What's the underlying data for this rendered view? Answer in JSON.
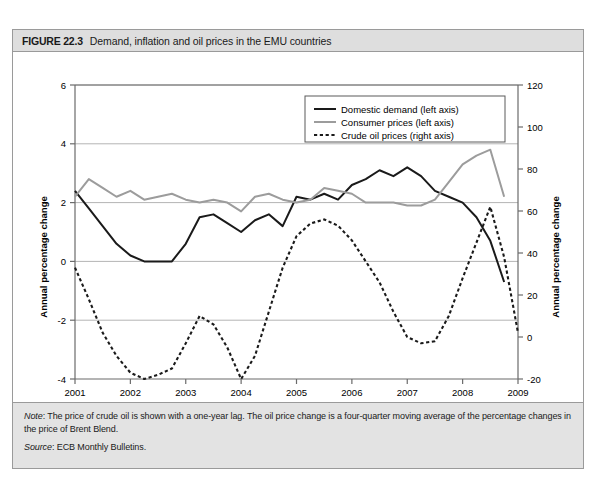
{
  "figure": {
    "number": "FIGURE 22.3",
    "title": "Demand, inflation and oil prices in the EMU countries"
  },
  "note": {
    "lead": "Note",
    "text": ": The price of crude oil is shown with a one-year lag. The oil price change is a four-quarter moving average of the percentage changes in the price of Brent Blend.",
    "source_lead": "Source",
    "source_text": ": ECB Monthly Bulletins."
  },
  "colors": {
    "demand": "#1a1a1a",
    "prices": "#9c9c9c",
    "oil": "#1a1a1a",
    "grid": "#b4b4b4",
    "axis": "#6b6b6b",
    "header_bg": "#dedede",
    "note_bg": "#e3e3e3"
  },
  "chart_data": {
    "type": "line",
    "title": "Demand, inflation and oil prices in the EMU countries",
    "xlabel": "",
    "ylabel": "Annual percentage change",
    "ylabel_right": "Annual percentage change",
    "xlim": [
      2001,
      2009
    ],
    "ylim": [
      -4,
      6
    ],
    "ylim_right": [
      -20,
      120
    ],
    "yticks": [
      -4,
      -2,
      0,
      2,
      4,
      6
    ],
    "yticks_right": [
      -20,
      0,
      20,
      40,
      60,
      80,
      100,
      120
    ],
    "xticks": [
      2001,
      2002,
      2003,
      2004,
      2005,
      2006,
      2007,
      2008,
      2009
    ],
    "xtick_labels": [
      "2001",
      "2002",
      "2003",
      "2004",
      "2005",
      "2006",
      "2007",
      "2008",
      "2009"
    ],
    "grid": true,
    "legend_position": "upper center",
    "series": [
      {
        "name": "Domestic demand (left axis)",
        "axis": "left",
        "style": "solid",
        "color": "#1a1a1a",
        "x": [
          2001.0,
          2001.25,
          2001.5,
          2001.75,
          2002.0,
          2002.25,
          2002.5,
          2002.75,
          2003.0,
          2003.25,
          2003.5,
          2003.75,
          2004.0,
          2004.25,
          2004.5,
          2004.75,
          2005.0,
          2005.25,
          2005.5,
          2005.75,
          2006.0,
          2006.25,
          2006.5,
          2006.75,
          2007.0,
          2007.25,
          2007.5,
          2007.75,
          2008.0,
          2008.25,
          2008.5,
          2008.75
        ],
        "values": [
          2.4,
          1.8,
          1.2,
          0.6,
          0.2,
          0.0,
          0.0,
          0.0,
          0.6,
          1.5,
          1.6,
          1.3,
          1.0,
          1.4,
          1.6,
          1.2,
          2.2,
          2.1,
          2.3,
          2.1,
          2.6,
          2.8,
          3.1,
          2.9,
          3.2,
          2.9,
          2.4,
          2.2,
          2.0,
          1.5,
          0.7,
          -0.7
        ]
      },
      {
        "name": "Consumer prices (left axis)",
        "axis": "left",
        "style": "solid",
        "color": "#9c9c9c",
        "x": [
          2001.0,
          2001.25,
          2001.5,
          2001.75,
          2002.0,
          2002.25,
          2002.5,
          2002.75,
          2003.0,
          2003.25,
          2003.5,
          2003.75,
          2004.0,
          2004.25,
          2004.5,
          2004.75,
          2005.0,
          2005.25,
          2005.5,
          2005.75,
          2006.0,
          2006.25,
          2006.5,
          2006.75,
          2007.0,
          2007.25,
          2007.5,
          2007.75,
          2008.0,
          2008.25,
          2008.5,
          2008.75
        ],
        "values": [
          2.2,
          2.8,
          2.5,
          2.2,
          2.4,
          2.1,
          2.2,
          2.3,
          2.1,
          2.0,
          2.1,
          2.0,
          1.7,
          2.2,
          2.3,
          2.1,
          2.0,
          2.1,
          2.5,
          2.4,
          2.3,
          2.0,
          2.0,
          2.0,
          1.9,
          1.9,
          2.1,
          2.7,
          3.3,
          3.6,
          3.8,
          2.2
        ]
      },
      {
        "name": "Crude oil prices (right axis)",
        "axis": "right",
        "style": "dashed",
        "color": "#1a1a1a",
        "x": [
          2001.0,
          2001.25,
          2001.5,
          2001.75,
          2002.0,
          2002.25,
          2002.5,
          2002.75,
          2003.0,
          2003.25,
          2003.5,
          2003.75,
          2004.0,
          2004.25,
          2004.5,
          2004.75,
          2005.0,
          2005.25,
          2005.5,
          2005.75,
          2006.0,
          2006.25,
          2006.5,
          2006.75,
          2007.0,
          2007.25,
          2007.5,
          2007.75,
          2008.0,
          2008.25,
          2008.5,
          2008.75,
          2009.0
        ],
        "values_right": [
          33,
          18,
          2,
          -9,
          -17,
          -20,
          -18,
          -15,
          -3,
          10,
          6,
          -5,
          -20,
          -9,
          12,
          33,
          48,
          54,
          56,
          53,
          46,
          36,
          26,
          12,
          0,
          -3,
          -2,
          10,
          28,
          45,
          62,
          38,
          2
        ]
      }
    ]
  },
  "legend": {
    "items": [
      {
        "label": "Domestic demand (left axis)",
        "style": "solid",
        "color": "#1a1a1a"
      },
      {
        "label": "Consumer prices (left axis)",
        "style": "solid",
        "color": "#9c9c9c"
      },
      {
        "label": "Crude oil prices (right axis)",
        "style": "dashed",
        "color": "#1a1a1a"
      }
    ]
  }
}
